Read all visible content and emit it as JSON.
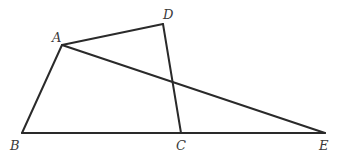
{
  "diagram": {
    "type": "geometry",
    "points": {
      "A": {
        "label": "A",
        "x": 62,
        "y": 45,
        "lx": 52,
        "ly": 42
      },
      "B": {
        "label": "B",
        "x": 22,
        "y": 133,
        "lx": 10,
        "ly": 150
      },
      "C": {
        "label": "C",
        "x": 181,
        "y": 133,
        "lx": 176,
        "ly": 150
      },
      "D": {
        "label": "D",
        "x": 163,
        "y": 24,
        "lx": 163,
        "ly": 19
      },
      "E": {
        "label": "E",
        "x": 325,
        "y": 133,
        "lx": 319,
        "ly": 150
      }
    },
    "segments": [
      {
        "name": "AB",
        "from": "A",
        "to": "B"
      },
      {
        "name": "AD",
        "from": "A",
        "to": "D"
      },
      {
        "name": "DC",
        "from": "D",
        "to": "C"
      },
      {
        "name": "BE",
        "from": "B",
        "to": "E"
      },
      {
        "name": "AE",
        "from": "A",
        "to": "E"
      }
    ]
  }
}
